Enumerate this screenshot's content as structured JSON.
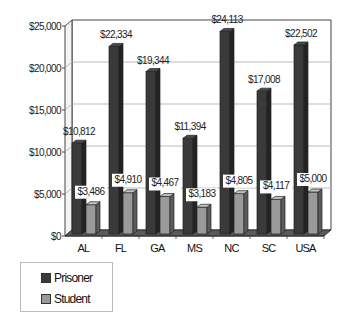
{
  "chart_data": {
    "type": "bar",
    "title": "",
    "xlabel": "",
    "ylabel": "",
    "three_d": true,
    "categories": [
      "AL",
      "FL",
      "GA",
      "MS",
      "NC",
      "SC",
      "USA"
    ],
    "series": [
      {
        "name": "Prisoner",
        "color": "#3a3a3a",
        "values": [
          10812,
          22334,
          19344,
          11394,
          24113,
          17008,
          22502
        ],
        "labels": [
          "$10,812",
          "$22,334",
          "$19,344",
          "$11,394",
          "$24,113",
          "$17,008",
          "$22,502"
        ]
      },
      {
        "name": "Student",
        "color": "#9a9a9a",
        "values": [
          3486,
          4910,
          4467,
          3183,
          4805,
          4117,
          5000
        ],
        "labels": [
          "$3,486",
          "$4,910",
          "$4,467",
          "$3,183",
          "$4,805",
          "$4,117",
          "$5,000"
        ]
      }
    ],
    "ylim": [
      0,
      25000
    ],
    "yticks": [
      0,
      5000,
      10000,
      15000,
      20000,
      25000
    ],
    "ytick_labels": [
      "$0",
      "$5,000",
      "$10,000",
      "$15,000",
      "$20,000",
      "$25,000"
    ],
    "grid": true,
    "legend_position": "bottom-left"
  },
  "legend": {
    "items": [
      {
        "label": "Prisoner",
        "color": "#3a3a3a"
      },
      {
        "label": "Student",
        "color": "#9a9a9a"
      }
    ]
  }
}
